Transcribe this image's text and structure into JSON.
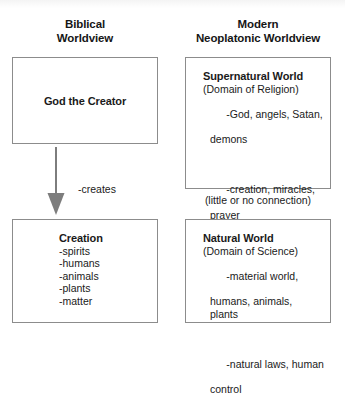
{
  "figure": {
    "type": "comparison-diagram",
    "columns": [
      {
        "id": "biblical",
        "heading_line1": "Biblical",
        "heading_line2": "Worldview"
      },
      {
        "id": "neoplatonic",
        "heading_line1": "Modern",
        "heading_line2": "Neoplatonic Worldview"
      }
    ]
  },
  "left": {
    "top_box": {
      "label": "God the Creator"
    },
    "arrow": {
      "icon": "down-arrow-icon",
      "color": "#7d7d7d",
      "note_line1": "-creates",
      "note_line2": "-sustains"
    },
    "bottom_box": {
      "title": "Creation",
      "bullets": [
        "-spirits",
        "-humans",
        "-animals",
        "-plants",
        "-matter"
      ]
    }
  },
  "right": {
    "top_box": {
      "title": "Supernatural World",
      "subtitle": "(Domain of Religion)",
      "bullets": [
        {
          "first": "-God, angels, Satan,",
          "cont": "demons"
        },
        {
          "first": "-creation, miracles,",
          "cont": "prayer"
        },
        {
          "first": "-related to ultimate",
          "cont": "questions"
        }
      ]
    },
    "connection_note": "(little or no connection)",
    "bottom_box": {
      "title": "Natural World",
      "subtitle": "(Domain of Science)",
      "bullets": [
        {
          "first": "-material world,",
          "cont": "humans, animals,\nplants"
        },
        {
          "first": "-natural laws, human",
          "cont": "control"
        }
      ]
    }
  },
  "colors": {
    "box_border": "#8c8c8c",
    "arrow": "#7d7d7d",
    "text": "#1a1a1a",
    "background": "#ffffff"
  }
}
